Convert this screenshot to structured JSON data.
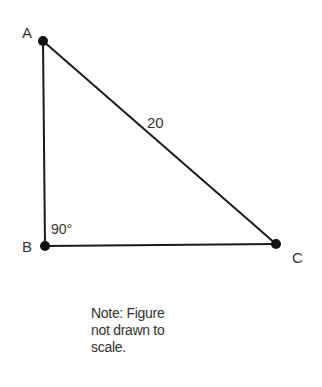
{
  "diagram": {
    "type": "right-triangle",
    "vertices": [
      {
        "label": "A",
        "x": 43,
        "y": 41
      },
      {
        "label": "B",
        "x": 45,
        "y": 246
      },
      {
        "label": "C",
        "x": 276,
        "y": 244
      }
    ],
    "angle_label": "90°",
    "hypotenuse_label": "20",
    "note": "Note: Figure not drawn to scale.",
    "note_lines": [
      "Note: Figure",
      "not drawn to",
      "scale."
    ],
    "stroke_color": "#1a1a1a"
  }
}
